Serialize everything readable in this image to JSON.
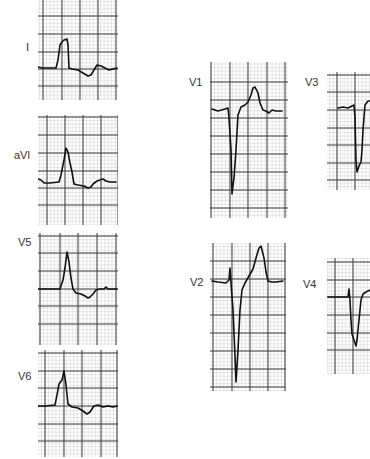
{
  "figure": {
    "type": "ecg-leads",
    "background": "#ffffff",
    "grid_minor_color": "#cfcfcf",
    "grid_major_color": "#3a3a3a",
    "trace_color": "#111111",
    "major_px": 18
  },
  "leads": [
    {
      "id": "I",
      "label": "I",
      "label_pos": [
        26,
        48
      ],
      "panel": {
        "x": 38,
        "y": 0,
        "w": 80,
        "h": 100
      },
      "major_x": [
        43,
        62,
        80,
        98,
        116
      ],
      "major_y": [
        16,
        34,
        52,
        69,
        86
      ],
      "trace": [
        [
          38,
          67
        ],
        [
          42,
          68
        ],
        [
          56,
          68
        ],
        [
          58,
          60
        ],
        [
          60,
          45
        ],
        [
          62,
          42
        ],
        [
          64,
          40
        ],
        [
          67,
          39
        ],
        [
          68,
          45
        ],
        [
          69,
          68
        ],
        [
          72,
          69
        ],
        [
          78,
          70
        ],
        [
          83,
          73
        ],
        [
          88,
          76
        ],
        [
          91,
          75
        ],
        [
          94,
          70
        ],
        [
          97,
          65
        ],
        [
          101,
          66
        ],
        [
          105,
          68
        ],
        [
          109,
          70
        ],
        [
          113,
          69
        ],
        [
          117,
          68
        ]
      ]
    },
    {
      "id": "aVl",
      "label": "aVl",
      "label_pos": [
        14,
        155
      ],
      "panel": {
        "x": 38,
        "y": 115,
        "w": 80,
        "h": 110
      },
      "major_x": [
        47,
        65,
        83,
        101,
        118
      ],
      "major_y": [
        117,
        135,
        153,
        171,
        188,
        205
      ],
      "trace": [
        [
          38,
          179
        ],
        [
          41,
          180
        ],
        [
          44,
          183
        ],
        [
          50,
          183
        ],
        [
          59,
          182
        ],
        [
          61,
          175
        ],
        [
          64,
          160
        ],
        [
          66,
          148
        ],
        [
          68,
          152
        ],
        [
          70,
          163
        ],
        [
          72,
          172
        ],
        [
          74,
          184
        ],
        [
          78,
          185
        ],
        [
          84,
          186
        ],
        [
          88,
          188
        ],
        [
          91,
          187
        ],
        [
          93,
          184
        ],
        [
          97,
          181
        ],
        [
          103,
          179
        ],
        [
          106,
          181
        ],
        [
          110,
          182
        ],
        [
          116,
          182
        ]
      ]
    },
    {
      "id": "V5",
      "label": "V5",
      "label_pos": [
        18,
        242
      ],
      "panel": {
        "x": 38,
        "y": 233,
        "w": 80,
        "h": 112
      },
      "major_x": [
        40,
        60,
        78,
        97,
        116
      ],
      "major_y": [
        236,
        253,
        271,
        289,
        306,
        324
      ],
      "trace": [
        [
          38,
          289
        ],
        [
          45,
          289
        ],
        [
          60,
          289
        ],
        [
          63,
          280
        ],
        [
          65,
          268
        ],
        [
          67,
          252
        ],
        [
          69,
          262
        ],
        [
          71,
          278
        ],
        [
          73,
          289
        ],
        [
          76,
          293
        ],
        [
          81,
          294
        ],
        [
          85,
          296
        ],
        [
          88,
          298
        ],
        [
          90,
          297
        ],
        [
          93,
          294
        ],
        [
          96,
          290
        ],
        [
          100,
          289
        ],
        [
          104,
          289
        ],
        [
          106,
          287
        ],
        [
          108,
          289
        ],
        [
          117,
          289
        ]
      ]
    },
    {
      "id": "V6",
      "label": "V6",
      "label_pos": [
        18,
        376
      ],
      "panel": {
        "x": 38,
        "y": 350,
        "w": 80,
        "h": 107
      },
      "major_x": [
        45,
        64,
        82,
        101,
        117
      ],
      "major_y": [
        353,
        371,
        388,
        406,
        424,
        441
      ],
      "trace": [
        [
          38,
          406
        ],
        [
          45,
          406
        ],
        [
          55,
          405
        ],
        [
          57,
          395
        ],
        [
          59,
          384
        ],
        [
          62,
          380
        ],
        [
          64,
          371
        ],
        [
          66,
          385
        ],
        [
          68,
          404
        ],
        [
          72,
          407
        ],
        [
          78,
          408
        ],
        [
          83,
          411
        ],
        [
          87,
          414
        ],
        [
          90,
          412
        ],
        [
          94,
          406
        ],
        [
          98,
          405
        ],
        [
          103,
          407
        ],
        [
          108,
          406
        ],
        [
          113,
          407
        ],
        [
          117,
          406
        ]
      ]
    },
    {
      "id": "V1",
      "label": "V1",
      "label_pos": [
        189,
        82
      ],
      "panel": {
        "x": 210,
        "y": 62,
        "w": 78,
        "h": 156
      },
      "major_x": [
        211,
        230,
        248,
        267,
        285
      ],
      "major_y": [
        82,
        100,
        118,
        136,
        154,
        172,
        190,
        208
      ],
      "trace": [
        [
          212,
          109
        ],
        [
          218,
          111
        ],
        [
          225,
          109
        ],
        [
          228,
          108
        ],
        [
          229,
          118
        ],
        [
          231,
          150
        ],
        [
          232,
          194
        ],
        [
          234,
          178
        ],
        [
          236,
          150
        ],
        [
          238,
          115
        ],
        [
          241,
          107
        ],
        [
          245,
          105
        ],
        [
          248,
          102
        ],
        [
          251,
          95
        ],
        [
          253,
          88
        ],
        [
          255,
          87
        ],
        [
          258,
          93
        ],
        [
          260,
          103
        ],
        [
          263,
          110
        ],
        [
          266,
          111
        ],
        [
          269,
          113
        ],
        [
          272,
          110
        ],
        [
          276,
          111
        ],
        [
          282,
          111
        ]
      ]
    },
    {
      "id": "V2",
      "label": "V2",
      "label_pos": [
        190,
        282
      ],
      "panel": {
        "x": 210,
        "y": 243,
        "w": 76,
        "h": 148
      },
      "major_x": [
        213,
        232,
        250,
        268,
        285
      ],
      "major_y": [
        261,
        279,
        297,
        315,
        333,
        351,
        369,
        387
      ],
      "trace": [
        [
          212,
          281
        ],
        [
          218,
          282
        ],
        [
          226,
          283
        ],
        [
          229,
          280
        ],
        [
          230,
          268
        ],
        [
          231,
          283
        ],
        [
          233,
          310
        ],
        [
          235,
          356
        ],
        [
          236,
          382
        ],
        [
          238,
          350
        ],
        [
          240,
          310
        ],
        [
          242,
          290
        ],
        [
          245,
          283
        ],
        [
          249,
          276
        ],
        [
          253,
          269
        ],
        [
          256,
          258
        ],
        [
          259,
          248
        ],
        [
          261,
          246
        ],
        [
          264,
          258
        ],
        [
          266,
          272
        ],
        [
          268,
          281
        ],
        [
          272,
          282
        ],
        [
          276,
          282
        ],
        [
          283,
          281
        ]
      ]
    },
    {
      "id": "V3",
      "label": "V3",
      "label_pos": [
        305,
        82
      ],
      "panel": {
        "x": 327,
        "y": 72,
        "w": 43,
        "h": 118
      },
      "major_x": [
        337,
        355
      ],
      "major_y": [
        75,
        92,
        110,
        128,
        145,
        163,
        180
      ],
      "trace": [
        [
          338,
          108
        ],
        [
          343,
          107
        ],
        [
          348,
          108
        ],
        [
          352,
          106
        ],
        [
          354,
          105
        ],
        [
          355,
          118
        ],
        [
          356,
          160
        ],
        [
          357,
          172
        ],
        [
          359,
          166
        ],
        [
          361,
          162
        ],
        [
          362,
          150
        ],
        [
          363,
          130
        ],
        [
          365,
          105
        ],
        [
          368,
          101
        ],
        [
          370,
          101
        ]
      ]
    },
    {
      "id": "V4",
      "label": "V4",
      "label_pos": [
        303,
        284
      ],
      "panel": {
        "x": 327,
        "y": 258,
        "w": 43,
        "h": 116
      },
      "major_x": [
        335,
        353
      ],
      "major_y": [
        262,
        280,
        297,
        315,
        333,
        350
      ],
      "trace": [
        [
          328,
          297
        ],
        [
          335,
          297
        ],
        [
          345,
          297
        ],
        [
          348,
          297
        ],
        [
          349,
          289
        ],
        [
          350,
          300
        ],
        [
          351,
          320
        ],
        [
          352,
          334
        ],
        [
          354,
          340
        ],
        [
          356,
          346
        ],
        [
          357,
          340
        ],
        [
          359,
          320
        ],
        [
          361,
          300
        ],
        [
          363,
          294
        ],
        [
          366,
          292
        ],
        [
          370,
          290
        ]
      ]
    }
  ]
}
